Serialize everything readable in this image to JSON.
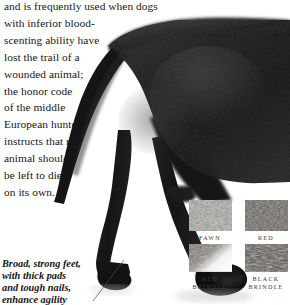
{
  "body": {
    "text": "and is frequently used when dogs\nwith inferior blood-\nscenting ability have\nlost the trail of a\nwounded animal;\nthe honor code\nof the middle\nEuropean hunter\ninstructs that no\nanimal should\nbe left to die\non its own."
  },
  "photo": {
    "subject": "black dog hindquarters with tail and hind legs",
    "silhouette_color": "#1b1b1b"
  },
  "caption": {
    "text": "Broad, strong feet,\nwith thick pads\nand tough nails,\nenhance agility"
  },
  "swatches": {
    "items": [
      {
        "label": "FAWN",
        "color": "#8d8b86",
        "texture": "fawn-coat-texture"
      },
      {
        "label": "RED",
        "color": "#55524e",
        "texture": "red-coat-texture"
      },
      {
        "label": "RED\nBRINDLE",
        "color": "#6e6a64",
        "texture": "red-brindle-coat-texture"
      },
      {
        "label": "BLACK\nBRINDLE",
        "color": "#4a4743",
        "texture": "black-brindle-coat-texture"
      }
    ]
  }
}
